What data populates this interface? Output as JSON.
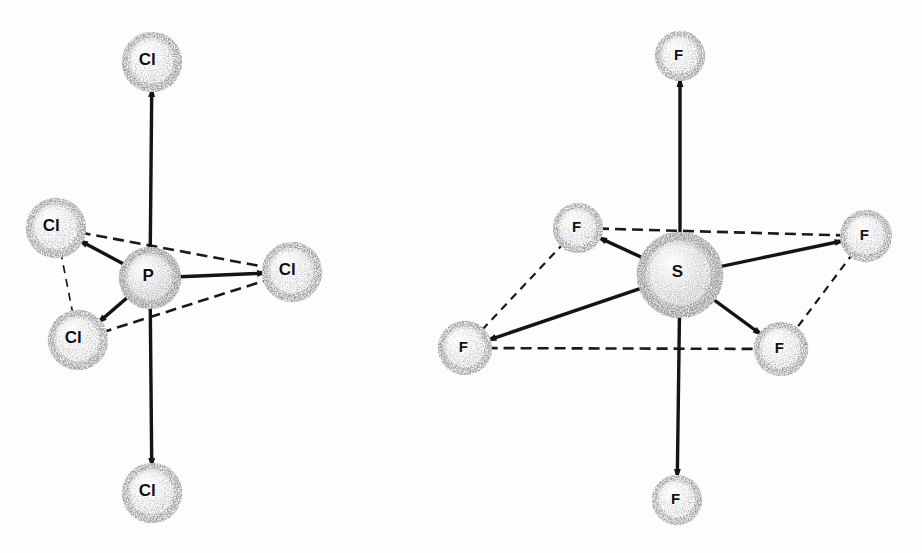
{
  "figure": {
    "background_color": "#fdfdfc",
    "ink_color": "#111111",
    "bond_color": "#141414",
    "dash_color": "#1a1a1a",
    "sphere_fill": "#fafafa",
    "sphere_speckle": "#2a2a2a"
  },
  "molecules": [
    {
      "id": "pcl5",
      "name": "phosphorus-pentachloride",
      "geometry": "trigonal-bipyramidal",
      "center": {
        "label": "P",
        "element": "P",
        "x": 150,
        "y": 278,
        "r": 31,
        "label_size": 17,
        "density": "high"
      },
      "ligands": [
        {
          "key": "axial-top",
          "label": "Cl",
          "x": 152,
          "y": 62,
          "r": 30,
          "label_size": 17,
          "position": "axial",
          "density": "low"
        },
        {
          "key": "axial-bottom",
          "label": "Cl",
          "x": 152,
          "y": 493,
          "r": 30,
          "label_size": 17,
          "position": "axial",
          "density": "low"
        },
        {
          "key": "equatorial-upper-left",
          "label": "Cl",
          "x": 56,
          "y": 228,
          "r": 30,
          "label_size": 17,
          "position": "equatorial",
          "density": "low"
        },
        {
          "key": "equatorial-lower-left",
          "label": "Cl",
          "x": 78,
          "y": 340,
          "r": 30,
          "label_size": 17,
          "position": "equatorial",
          "density": "low"
        },
        {
          "key": "equatorial-right",
          "label": "Cl",
          "x": 292,
          "y": 272,
          "r": 30,
          "label_size": 17,
          "position": "equatorial",
          "density": "low"
        }
      ],
      "bonds": [
        {
          "from": "center",
          "to": "axial-top",
          "style": "solid",
          "width": 3.4
        },
        {
          "from": "center",
          "to": "axial-bottom",
          "style": "solid",
          "width": 3.4
        },
        {
          "from": "center",
          "to": "equatorial-upper-left",
          "style": "solid",
          "width": 3.4
        },
        {
          "from": "center",
          "to": "equatorial-lower-left",
          "style": "solid",
          "width": 3.4
        },
        {
          "from": "center",
          "to": "equatorial-right",
          "style": "solid",
          "width": 3.4
        }
      ],
      "guides": [
        {
          "from": "equatorial-upper-left",
          "to": "equatorial-right",
          "style": "dashed",
          "width": 2.6
        },
        {
          "from": "equatorial-lower-left",
          "to": "equatorial-right",
          "style": "dashed",
          "width": 2.6
        },
        {
          "from": "equatorial-upper-left",
          "to": "equatorial-lower-left",
          "style": "dashed",
          "width": 1.7
        }
      ]
    },
    {
      "id": "sf6",
      "name": "sulfur-hexafluoride",
      "geometry": "octahedral",
      "center": {
        "label": "S",
        "element": "S",
        "x": 680,
        "y": 275,
        "r": 43,
        "label_size": 17,
        "density": "high"
      },
      "ligands": [
        {
          "key": "axial-top",
          "label": "F",
          "x": 680,
          "y": 56,
          "r": 25,
          "label_size": 15,
          "position": "axial",
          "density": "low"
        },
        {
          "key": "axial-bottom",
          "label": "F",
          "x": 677,
          "y": 500,
          "r": 25,
          "label_size": 15,
          "position": "axial",
          "density": "low"
        },
        {
          "key": "equatorial-back-left",
          "label": "F",
          "x": 578,
          "y": 228,
          "r": 25,
          "label_size": 15,
          "position": "equatorial",
          "density": "low"
        },
        {
          "key": "equatorial-back-right",
          "label": "F",
          "x": 866,
          "y": 236,
          "r": 26,
          "label_size": 15,
          "position": "equatorial",
          "density": "low"
        },
        {
          "key": "equatorial-front-left",
          "label": "F",
          "x": 465,
          "y": 348,
          "r": 27,
          "label_size": 15,
          "position": "equatorial",
          "density": "low"
        },
        {
          "key": "equatorial-front-right",
          "label": "F",
          "x": 781,
          "y": 349,
          "r": 27,
          "label_size": 15,
          "position": "equatorial",
          "density": "low"
        }
      ],
      "bonds": [
        {
          "from": "center",
          "to": "axial-top",
          "style": "solid",
          "width": 3.4
        },
        {
          "from": "center",
          "to": "axial-bottom",
          "style": "solid",
          "width": 3.4
        },
        {
          "from": "center",
          "to": "equatorial-back-left",
          "style": "solid",
          "width": 3.4
        },
        {
          "from": "center",
          "to": "equatorial-back-right",
          "style": "solid",
          "width": 3.4
        },
        {
          "from": "center",
          "to": "equatorial-front-left",
          "style": "solid",
          "width": 3.4
        },
        {
          "from": "center",
          "to": "equatorial-front-right",
          "style": "solid",
          "width": 3.4
        }
      ],
      "guides": [
        {
          "from": "equatorial-back-left",
          "to": "equatorial-back-right",
          "style": "dashed",
          "width": 2.6
        },
        {
          "from": "equatorial-front-left",
          "to": "equatorial-front-right",
          "style": "dashed",
          "width": 2.6
        },
        {
          "from": "equatorial-back-left",
          "to": "equatorial-front-left",
          "style": "dashed",
          "width": 2.2
        },
        {
          "from": "equatorial-back-right",
          "to": "equatorial-front-right",
          "style": "dashed",
          "width": 2.2
        }
      ]
    }
  ]
}
